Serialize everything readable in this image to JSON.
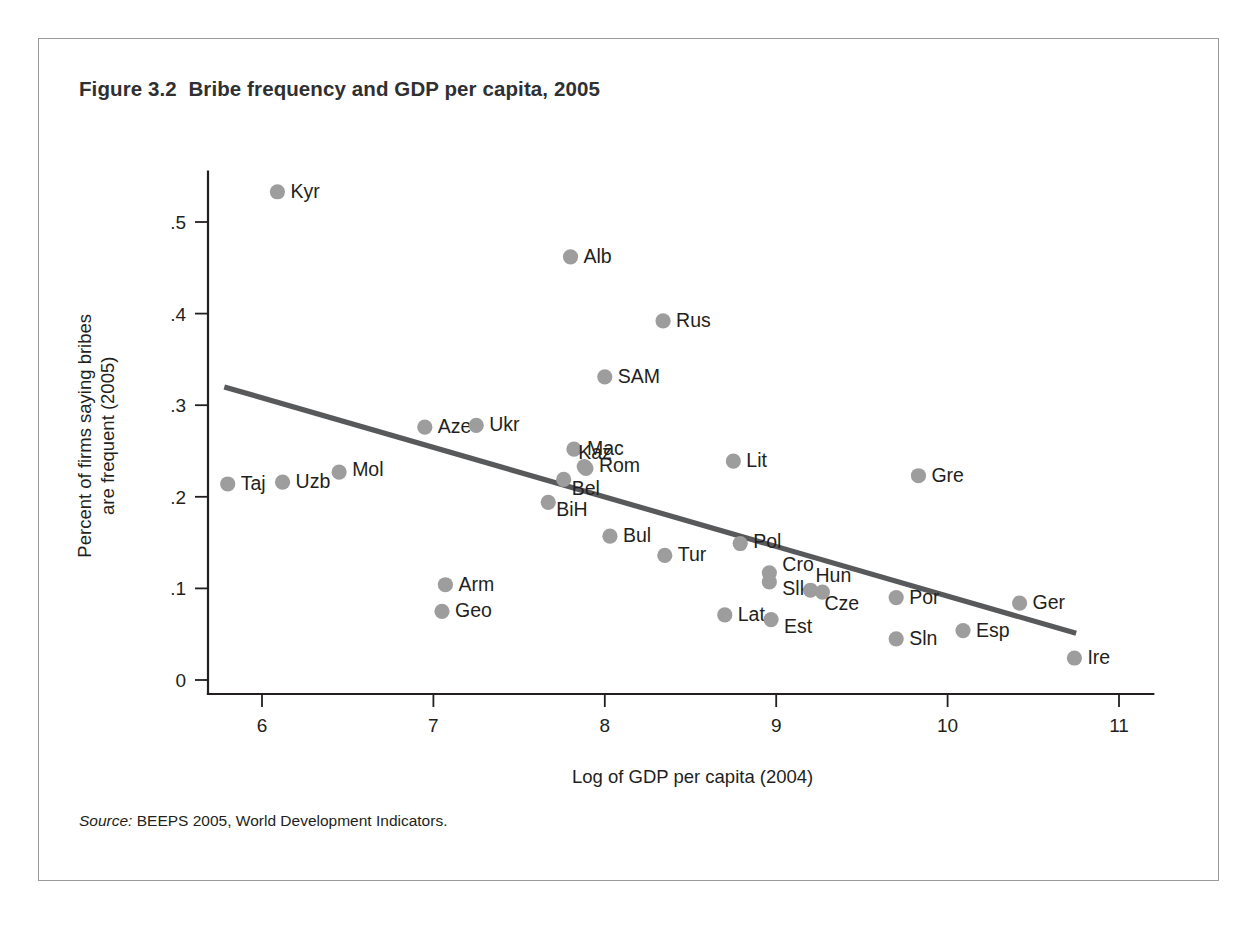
{
  "figure": {
    "title": "Figure 3.2  Bribe frequency and GDP per capita, 2005",
    "source_label": "Source:",
    "source_text": " BEEPS 2005, World Development Indicators."
  },
  "chart_data": {
    "type": "scatter",
    "title": "Figure 3.2  Bribe frequency and GDP per capita, 2005",
    "xlabel": "Log of GDP per capita (2004)",
    "ylabel": "Percent of firms saying bribes\nare frequent (2005)",
    "ylabel_line1": "Percent of firms saying bribes",
    "ylabel_line2": "are frequent (2005)",
    "xlim": [
      5.72,
      11.2
    ],
    "ylim": [
      0,
      0.555
    ],
    "xticks": [
      6,
      7,
      8,
      9,
      10,
      11
    ],
    "xticklabels": [
      "6",
      "7",
      "8",
      "9",
      "10",
      "11"
    ],
    "yticks": [
      0,
      0.1,
      0.2,
      0.3,
      0.4,
      0.5
    ],
    "yticklabels": [
      "0",
      ".1",
      ".2",
      ".3",
      ".4",
      ".5"
    ],
    "grid": false,
    "legend": false,
    "marker_color": "#9d9d9d",
    "trendline_color": "#58595b",
    "trendline": {
      "x": [
        5.78,
        10.75
      ],
      "y": [
        0.32,
        0.051
      ]
    },
    "points": [
      {
        "label": "Kyr",
        "x": 6.09,
        "y": 0.533,
        "label_dx": 13,
        "label_dy": 6
      },
      {
        "label": "Alb",
        "x": 7.8,
        "y": 0.462,
        "label_dx": 13,
        "label_dy": 6
      },
      {
        "label": "Rus",
        "x": 8.34,
        "y": 0.392,
        "label_dx": 13,
        "label_dy": 6
      },
      {
        "label": "SAM",
        "x": 8.0,
        "y": 0.331,
        "label_dx": 13,
        "label_dy": 6
      },
      {
        "label": "Aze",
        "x": 6.95,
        "y": 0.276,
        "label_dx": 13,
        "label_dy": 6
      },
      {
        "label": "Ukr",
        "x": 7.25,
        "y": 0.278,
        "label_dx": 13,
        "label_dy": 6
      },
      {
        "label": "Mac",
        "x": 7.82,
        "y": 0.252,
        "label_dx": 13,
        "label_dy": 6
      },
      {
        "label": "Rom",
        "x": 7.89,
        "y": 0.231,
        "label_dx": 13,
        "label_dy": 4
      },
      {
        "label": "Kaz",
        "x": 7.88,
        "y": 0.233,
        "label_dx": -6,
        "label_dy": -8
      },
      {
        "label": "Bel",
        "x": 7.76,
        "y": 0.219,
        "label_dx": 8,
        "label_dy": 16
      },
      {
        "label": "Taj",
        "x": 5.8,
        "y": 0.214,
        "label_dx": 13,
        "label_dy": 6
      },
      {
        "label": "Uzb",
        "x": 6.12,
        "y": 0.216,
        "label_dx": 13,
        "label_dy": 6
      },
      {
        "label": "Mol",
        "x": 6.45,
        "y": 0.227,
        "label_dx": 13,
        "label_dy": 4
      },
      {
        "label": "Gre",
        "x": 9.83,
        "y": 0.223,
        "label_dx": 13,
        "label_dy": 6
      },
      {
        "label": "Lit",
        "x": 8.75,
        "y": 0.239,
        "label_dx": 13,
        "label_dy": 6
      },
      {
        "label": "BiH",
        "x": 7.67,
        "y": 0.194,
        "label_dx": 8,
        "label_dy": 14
      },
      {
        "label": "Bul",
        "x": 8.03,
        "y": 0.157,
        "label_dx": 13,
        "label_dy": 6
      },
      {
        "label": "Tur",
        "x": 8.35,
        "y": 0.136,
        "label_dx": 13,
        "label_dy": 6
      },
      {
        "label": "Pol",
        "x": 8.79,
        "y": 0.149,
        "label_dx": 13,
        "label_dy": 4
      },
      {
        "label": "Cro",
        "x": 8.96,
        "y": 0.117,
        "label_dx": 13,
        "label_dy": -2
      },
      {
        "label": "Slk",
        "x": 8.96,
        "y": 0.107,
        "label_dx": 13,
        "label_dy": 13
      },
      {
        "label": "Arm",
        "x": 7.07,
        "y": 0.104,
        "label_dx": 13,
        "label_dy": 6
      },
      {
        "label": "Geo",
        "x": 7.05,
        "y": 0.075,
        "label_dx": 13,
        "label_dy": 6
      },
      {
        "label": "Hun",
        "x": 9.2,
        "y": 0.098,
        "label_dx": 5,
        "label_dy": -8
      },
      {
        "label": "Cze",
        "x": 9.27,
        "y": 0.096,
        "label_dx": 2,
        "label_dy": 18
      },
      {
        "label": "Por",
        "x": 9.7,
        "y": 0.09,
        "label_dx": 13,
        "label_dy": 6
      },
      {
        "label": "Ger",
        "x": 10.42,
        "y": 0.084,
        "label_dx": 13,
        "label_dy": 6
      },
      {
        "label": "Lat",
        "x": 8.7,
        "y": 0.071,
        "label_dx": 13,
        "label_dy": 6
      },
      {
        "label": "Est",
        "x": 8.97,
        "y": 0.066,
        "label_dx": 13,
        "label_dy": 13
      },
      {
        "label": "Esp",
        "x": 10.09,
        "y": 0.054,
        "label_dx": 13,
        "label_dy": 6
      },
      {
        "label": "Sln",
        "x": 9.7,
        "y": 0.045,
        "label_dx": 13,
        "label_dy": 6
      },
      {
        "label": "Ire",
        "x": 10.74,
        "y": 0.024,
        "label_dx": 13,
        "label_dy": 6
      }
    ]
  }
}
